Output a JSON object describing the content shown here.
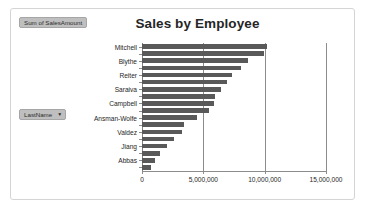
{
  "window": {
    "border_color": "#d4d4d4",
    "background": "#ffffff"
  },
  "value_field_button": {
    "label": "Sum of SalesAmount",
    "fill": "#bfbfbf"
  },
  "row_field_button": {
    "label": "LastName",
    "caret": "▼",
    "fill": "#bfbfbf"
  },
  "chart_data": {
    "type": "bar",
    "orientation": "horizontal",
    "title": "Sales by Employee",
    "xlabel": "",
    "ylabel": "",
    "xlim": [
      0,
      15000000
    ],
    "grid": true,
    "gridlines_x": [
      0,
      5000000,
      10000000,
      15000000
    ],
    "xtick_labels": [
      "0",
      "5,000,000",
      "10,000,000",
      "15,000,000"
    ],
    "legend": false,
    "legend_position": "none",
    "series_color": "#595959",
    "visible_category_labels": [
      "Mitchell",
      "Blythe",
      "Reiter",
      "Saraiva",
      "Campbell",
      "Ansman-Wolfe",
      "Valdez",
      "Jiang",
      "Abbas"
    ],
    "categories": [
      "Mitchell",
      "",
      "Blythe",
      "",
      "Reiter",
      "",
      "Saraiva",
      "",
      "Campbell",
      "",
      "Ansman-Wolfe",
      "",
      "Valdez",
      "",
      "Jiang",
      "",
      "Abbas",
      ""
    ],
    "values": [
      10200000,
      9950000,
      8650000,
      8100000,
      7350000,
      6950000,
      6450000,
      5950000,
      5870000,
      5450000,
      4500000,
      3450000,
      3250000,
      2600000,
      2050000,
      1500000,
      1100000,
      700000
    ],
    "bar_count": 18
  }
}
